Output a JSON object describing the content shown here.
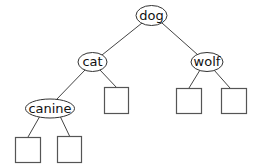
{
  "diagram": {
    "type": "binary-tree",
    "colors": {
      "stroke": "#333333",
      "fill": "#ffffff",
      "text": "#111111"
    },
    "nodes": [
      {
        "id": "dog",
        "label": "dog"
      },
      {
        "id": "cat",
        "label": "cat"
      },
      {
        "id": "wolf",
        "label": "wolf"
      },
      {
        "id": "canine",
        "label": "canine"
      }
    ],
    "edges": [
      [
        "dog",
        "cat"
      ],
      [
        "dog",
        "wolf"
      ],
      [
        "cat",
        "canine"
      ],
      [
        "cat",
        "leaf-cat-right"
      ],
      [
        "wolf",
        "leaf-wolf-left"
      ],
      [
        "wolf",
        "leaf-wolf-right"
      ],
      [
        "canine",
        "leaf-canine-left"
      ],
      [
        "canine",
        "leaf-canine-right"
      ]
    ],
    "leaves": [
      "leaf-cat-right",
      "leaf-wolf-left",
      "leaf-wolf-right",
      "leaf-canine-left",
      "leaf-canine-right"
    ]
  }
}
